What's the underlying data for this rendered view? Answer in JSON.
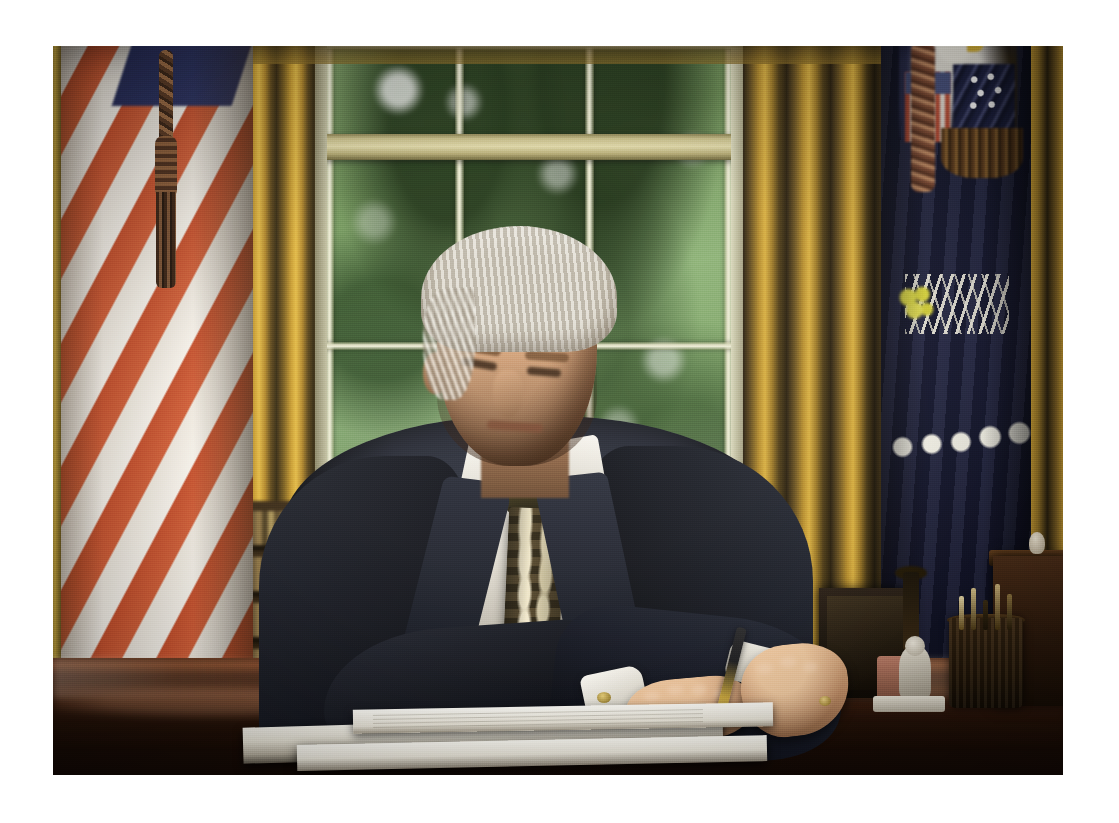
{
  "image": {
    "kind": "photograph",
    "title": "President signing a document at the Resolute desk in the Oval Office",
    "canvas": {
      "width": 1119,
      "height": 823,
      "background_color": "#ffffff"
    },
    "photo_frame": {
      "left": 53,
      "top": 46,
      "width": 1010,
      "height": 729,
      "border_color": "#ffffff"
    },
    "orientation": "landscape",
    "lighting": "soft daylight from window behind subject"
  },
  "scene": {
    "location_label": "Oval Office",
    "subject": {
      "name": "subject-president",
      "pose": "seated at desk, head bowed, signing with right hand",
      "hair_color": "#e4dfd2",
      "skin_color": "#c2906a",
      "suit_color": "#141722",
      "shirt_color": "#f4f1ea",
      "tie_color": "#4b3f24",
      "tie_pattern": "gold-and-navy oval medallion repeat",
      "pen_color": "#d7b84a"
    },
    "background": {
      "wall_color": "#2a2414",
      "window": {
        "name": "oval-office-window",
        "casing_color": "#e2e1c6",
        "glass_view": "blurred green summer foliage",
        "foliage_color": "#7fa069",
        "panes_across": 3,
        "panes_down": 2,
        "has_meeting_rail": true
      },
      "drapes": {
        "name": "gold-drapes",
        "color": "#c79b2f",
        "shadow_color": "#32270f",
        "positions": [
          "left of window",
          "right of window",
          "far right"
        ]
      },
      "flags": [
        {
          "name": "flag-united-states",
          "position": "left",
          "stripe_red": "#c9522e",
          "stripe_white": "#f2ece2",
          "canton_color": "#2a3160",
          "has_tassel_cord": true,
          "tassel_color": "#8c5e3a"
        },
        {
          "name": "flag-presidential",
          "position": "right",
          "field_color": "#171a33",
          "eagle_color": "#e9e6dd",
          "stars_color": "#f0eee4",
          "olive_branch_color": "#e6e24a",
          "arrows_color": "#ebe8dc",
          "fringe_color": "#8b6330"
        }
      ],
      "bookshelf": {
        "name": "bookshelf",
        "visible": true,
        "shelf_color": "#6e5a38"
      }
    },
    "desk": {
      "name": "resolute-desk",
      "surface_color": "#3a1d0e",
      "finish": "dark polished mahogany with specular reflections",
      "has_reflection": true
    },
    "desk_items": [
      {
        "name": "document-folder",
        "type": "open leather folder with white pages",
        "color": "#f2efe6"
      },
      {
        "name": "signing-paper",
        "type": "printed document sheet",
        "color": "#fbfaf4"
      },
      {
        "name": "picture-frame",
        "type": "dark standing photo frame",
        "color": "#2a2016"
      },
      {
        "name": "figurine",
        "type": "small porcelain seated figure",
        "color": "#e9e4d6"
      },
      {
        "name": "pen-holder",
        "type": "wooden cup holding pens and letter opener",
        "color": "#3e2a14"
      },
      {
        "name": "inkwell",
        "type": "silver-capped inkwell",
        "color": "#4a4a50"
      },
      {
        "name": "candlestick",
        "type": "dark metal candlestick",
        "color": "#221805"
      },
      {
        "name": "wooden-box",
        "type": "mahogany desk box",
        "color": "#4a2d18"
      }
    ]
  },
  "palette": {
    "gold": "#c79b2f",
    "flag_red": "#c9522e",
    "navy": "#171a33",
    "foliage_green": "#7fa069",
    "mahogany": "#3a1d0e",
    "cream": "#f2ece2",
    "suit_navy": "#141722"
  }
}
